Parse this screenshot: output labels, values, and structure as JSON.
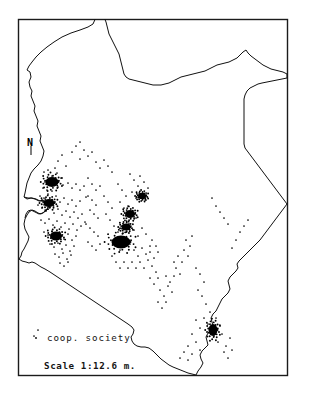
{
  "figure": {
    "kind": "dot-density-map",
    "region_name": "Kenya",
    "background_color": "#ffffff",
    "ink_color": "#111111",
    "frame": {
      "x": 18,
      "y": 19,
      "width": 270,
      "height": 357
    }
  },
  "legend": {
    "symbol_name": "dot-symbol",
    "label": "coop. society",
    "scale_label": "Scale 1:12.6 m."
  },
  "north_indicator": {
    "label": "N",
    "x": 30,
    "y": 142
  },
  "chart_data": {
    "type": "scatter",
    "title": "",
    "xlabel": "",
    "ylabel": "",
    "grid": false,
    "legend_position": "bottom-left",
    "series": [
      {
        "name": "coop. society",
        "marker": "dot",
        "color": "#000000",
        "points": [
          [
            62,
            155
          ],
          [
            58,
            161
          ],
          [
            72,
            152
          ],
          [
            80,
            159
          ],
          [
            55,
            168
          ],
          [
            66,
            166
          ],
          [
            44,
            172
          ],
          [
            48,
            170
          ],
          [
            52,
            176
          ],
          [
            57,
            173
          ],
          [
            61,
            178
          ],
          [
            45,
            182
          ],
          [
            50,
            184
          ],
          [
            54,
            181
          ],
          [
            43,
            188
          ],
          [
            47,
            190
          ],
          [
            52,
            191
          ],
          [
            58,
            187
          ],
          [
            63,
            185
          ],
          [
            68,
            183
          ],
          [
            72,
            188
          ],
          [
            76,
            184
          ],
          [
            80,
            190
          ],
          [
            84,
            186
          ],
          [
            40,
            196
          ],
          [
            44,
            198
          ],
          [
            48,
            194
          ],
          [
            52,
            200
          ],
          [
            56,
            196
          ],
          [
            60,
            202
          ],
          [
            64,
            198
          ],
          [
            68,
            204
          ],
          [
            72,
            200
          ],
          [
            76,
            206
          ],
          [
            80,
            201
          ],
          [
            86,
            197
          ],
          [
            38,
            205
          ],
          [
            42,
            208
          ],
          [
            46,
            211
          ],
          [
            50,
            207
          ],
          [
            54,
            213
          ],
          [
            58,
            209
          ],
          [
            62,
            215
          ],
          [
            66,
            211
          ],
          [
            70,
            217
          ],
          [
            74,
            212
          ],
          [
            78,
            218
          ],
          [
            82,
            214
          ],
          [
            41,
            220
          ],
          [
            45,
            223
          ],
          [
            49,
            219
          ],
          [
            53,
            225
          ],
          [
            57,
            221
          ],
          [
            61,
            227
          ],
          [
            65,
            223
          ],
          [
            69,
            229
          ],
          [
            73,
            224
          ],
          [
            77,
            230
          ],
          [
            81,
            226
          ],
          [
            85,
            222
          ],
          [
            44,
            232
          ],
          [
            48,
            235
          ],
          [
            52,
            231
          ],
          [
            56,
            237
          ],
          [
            60,
            233
          ],
          [
            64,
            239
          ],
          [
            68,
            234
          ],
          [
            72,
            240
          ],
          [
            76,
            236
          ],
          [
            50,
            244
          ],
          [
            54,
            247
          ],
          [
            58,
            243
          ],
          [
            62,
            249
          ],
          [
            66,
            245
          ],
          [
            70,
            251
          ],
          [
            74,
            246
          ],
          [
            55,
            254
          ],
          [
            59,
            257
          ],
          [
            63,
            253
          ],
          [
            67,
            259
          ],
          [
            71,
            255
          ],
          [
            60,
            263
          ],
          [
            64,
            266
          ],
          [
            68,
            262
          ],
          [
            88,
            178
          ],
          [
            92,
            184
          ],
          [
            96,
            190
          ],
          [
            100,
            186
          ],
          [
            88,
            196
          ],
          [
            92,
            200
          ],
          [
            96,
            205
          ],
          [
            90,
            210
          ],
          [
            94,
            214
          ],
          [
            98,
            218
          ],
          [
            86,
            224
          ],
          [
            90,
            228
          ],
          [
            94,
            232
          ],
          [
            98,
            236
          ],
          [
            88,
            242
          ],
          [
            92,
            246
          ],
          [
            96,
            250
          ],
          [
            100,
            244
          ],
          [
            104,
            196
          ],
          [
            108,
            202
          ],
          [
            112,
            208
          ],
          [
            106,
            214
          ],
          [
            110,
            220
          ],
          [
            118,
            184
          ],
          [
            122,
            190
          ],
          [
            126,
            196
          ],
          [
            120,
            202
          ],
          [
            124,
            208
          ],
          [
            130,
            174
          ],
          [
            134,
            180
          ],
          [
            138,
            186
          ],
          [
            132,
            192
          ],
          [
            136,
            198
          ],
          [
            140,
            176
          ],
          [
            144,
            182
          ],
          [
            148,
            188
          ],
          [
            142,
            194
          ],
          [
            146,
            200
          ],
          [
            128,
            206
          ],
          [
            132,
            212
          ],
          [
            136,
            218
          ],
          [
            130,
            224
          ],
          [
            134,
            230
          ],
          [
            138,
            236
          ],
          [
            142,
            228
          ],
          [
            146,
            234
          ],
          [
            126,
            238
          ],
          [
            130,
            244
          ],
          [
            134,
            250
          ],
          [
            138,
            256
          ],
          [
            142,
            248
          ],
          [
            146,
            254
          ],
          [
            150,
            246
          ],
          [
            114,
            226
          ],
          [
            118,
            232
          ],
          [
            122,
            238
          ],
          [
            116,
            244
          ],
          [
            120,
            250
          ],
          [
            112,
            256
          ],
          [
            116,
            262
          ],
          [
            120,
            268
          ],
          [
            124,
            262
          ],
          [
            128,
            268
          ],
          [
            132,
            262
          ],
          [
            136,
            268
          ],
          [
            140,
            262
          ],
          [
            144,
            268
          ],
          [
            148,
            260
          ],
          [
            152,
            240
          ],
          [
            156,
            246
          ],
          [
            150,
            252
          ],
          [
            154,
            258
          ],
          [
            158,
            252
          ],
          [
            152,
            266
          ],
          [
            156,
            272
          ],
          [
            150,
            278
          ],
          [
            154,
            284
          ],
          [
            158,
            278
          ],
          [
            160,
            290
          ],
          [
            164,
            296
          ],
          [
            158,
            302
          ],
          [
            162,
            308
          ],
          [
            166,
            302
          ],
          [
            168,
            286
          ],
          [
            172,
            292
          ],
          [
            166,
            276
          ],
          [
            170,
            282
          ],
          [
            174,
            276
          ],
          [
            176,
            268
          ],
          [
            180,
            274
          ],
          [
            174,
            262
          ],
          [
            178,
            256
          ],
          [
            182,
            262
          ],
          [
            184,
            250
          ],
          [
            188,
            256
          ],
          [
            186,
            240
          ],
          [
            190,
            246
          ],
          [
            192,
            236
          ],
          [
            196,
            268
          ],
          [
            200,
            274
          ],
          [
            204,
            282
          ],
          [
            198,
            290
          ],
          [
            202,
            296
          ],
          [
            206,
            304
          ],
          [
            210,
            312
          ],
          [
            204,
            318
          ],
          [
            208,
            324
          ],
          [
            212,
            330
          ],
          [
            216,
            318
          ],
          [
            220,
            326
          ],
          [
            214,
            336
          ],
          [
            218,
            342
          ],
          [
            222,
            334
          ],
          [
            226,
            346
          ],
          [
            230,
            338
          ],
          [
            224,
            352
          ],
          [
            228,
            358
          ],
          [
            232,
            350
          ],
          [
            196,
            320
          ],
          [
            200,
            328
          ],
          [
            192,
            334
          ],
          [
            196,
            342
          ],
          [
            200,
            350
          ],
          [
            188,
            346
          ],
          [
            192,
            354
          ],
          [
            184,
            352
          ],
          [
            188,
            360
          ],
          [
            180,
            358
          ],
          [
            240,
            232
          ],
          [
            236,
            240
          ],
          [
            244,
            226
          ],
          [
            232,
            248
          ],
          [
            248,
            220
          ],
          [
            216,
            206
          ],
          [
            220,
            212
          ],
          [
            212,
            198
          ],
          [
            224,
            218
          ],
          [
            228,
            224
          ],
          [
            104,
            160
          ],
          [
            108,
            166
          ],
          [
            112,
            172
          ],
          [
            100,
            168
          ],
          [
            96,
            162
          ],
          [
            84,
            150
          ],
          [
            88,
            156
          ],
          [
            76,
            146
          ],
          [
            92,
            152
          ],
          [
            80,
            142
          ],
          [
            38,
            330
          ],
          [
            34,
            336
          ]
        ],
        "cluster_blobs": [
          {
            "name": "kakamega-cluster",
            "cx": 52,
            "cy": 182,
            "rx": 6.5,
            "ry": 5.0
          },
          {
            "name": "kisumu-cluster",
            "cx": 49,
            "cy": 203,
            "rx": 5.5,
            "ry": 4.0
          },
          {
            "name": "kisii-cluster",
            "cx": 56,
            "cy": 236,
            "rx": 6.0,
            "ry": 4.5
          },
          {
            "name": "nyeri-cluster",
            "cx": 130,
            "cy": 214,
            "rx": 5.0,
            "ry": 4.0
          },
          {
            "name": "nairobi-cluster",
            "cx": 121,
            "cy": 242,
            "rx": 9.5,
            "ry": 6.5
          },
          {
            "name": "muranga-cluster",
            "cx": 126,
            "cy": 227,
            "rx": 4.5,
            "ry": 3.5
          },
          {
            "name": "embu-cluster",
            "cx": 142,
            "cy": 196,
            "rx": 4.0,
            "ry": 3.2
          },
          {
            "name": "mombasa-cluster",
            "cx": 213,
            "cy": 330,
            "rx": 4.5,
            "ry": 6.0
          }
        ]
      }
    ]
  }
}
